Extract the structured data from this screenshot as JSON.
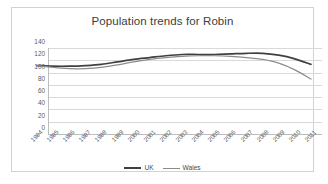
{
  "chart_data": {
    "type": "line",
    "title": "Population trends for Robin",
    "xlabel": "",
    "ylabel": "",
    "ylim": [
      0,
      140
    ],
    "yticks": [
      0,
      20,
      40,
      60,
      80,
      100,
      120,
      140
    ],
    "grid": true,
    "legend_position": "bottom-center",
    "categories": [
      "1994",
      "1995",
      "1996",
      "1997",
      "1998",
      "1999",
      "2000",
      "2001",
      "2002",
      "2003",
      "2004",
      "2005",
      "2006",
      "2007",
      "2008",
      "2009",
      "2010",
      "2011"
    ],
    "series": [
      {
        "name": "UK",
        "color": "#404040",
        "values": [
          100,
          99,
          99,
          100,
          102,
          106,
          110,
          113,
          116,
          118,
          118,
          118,
          119,
          120,
          120,
          117,
          111,
          102
        ]
      },
      {
        "name": "Wales",
        "color": "#8c8c8c",
        "values": [
          100,
          97,
          95,
          95,
          97,
          101,
          106,
          110,
          113,
          115,
          116,
          116,
          115,
          113,
          110,
          104,
          93,
          78
        ]
      }
    ]
  },
  "legend": {
    "entries": [
      {
        "label": "UK",
        "color": "#404040"
      },
      {
        "label": "Wales",
        "color": "#8c8c8c"
      }
    ]
  },
  "colors": {
    "frame_border": "#d2d2d2",
    "gridline": "#d9d9d9",
    "axis": "#bdbdbd",
    "title_text": "#3d3d3d",
    "tick_text": "#5a5a5a",
    "background": "#ffffff"
  }
}
